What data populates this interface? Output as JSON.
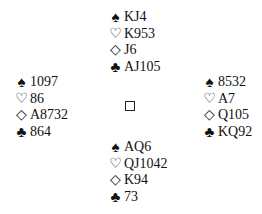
{
  "icons": {
    "spade": "♠",
    "heart": "♡",
    "diamond": "◇",
    "club": "♣"
  },
  "hands": {
    "north": {
      "spades": "KJ4",
      "hearts": "K953",
      "diamonds": "J6",
      "clubs": "AJ105"
    },
    "west": {
      "spades": "1097",
      "hearts": "86",
      "diamonds": "A8732",
      "clubs": "864"
    },
    "east": {
      "spades": "8532",
      "hearts": "A7",
      "diamonds": "Q105",
      "clubs": "KQ92"
    },
    "south": {
      "spades": "AQ6",
      "hearts": "QJ1042",
      "diamonds": "K94",
      "clubs": "73"
    }
  },
  "center": {
    "symbol": "table-square"
  }
}
